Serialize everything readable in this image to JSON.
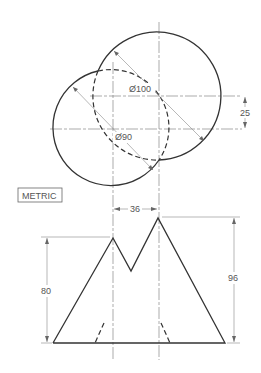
{
  "drawing": {
    "units_label": "METRIC",
    "top_view": {
      "large_circle": {
        "label": "Ø100",
        "cx": 159,
        "cy": 96,
        "r": 64
      },
      "small_circle": {
        "label": "Ø90",
        "cx": 113,
        "cy": 129,
        "r": 58
      },
      "center_offset_dim": "25"
    },
    "front_view": {
      "peak_spacing_dim": "36",
      "left_height_dim": "80",
      "right_height_dim": "96"
    },
    "colors": {
      "object_line": "#333333",
      "dimension_line": "#888888",
      "text": "#555555",
      "background": "#ffffff"
    }
  }
}
